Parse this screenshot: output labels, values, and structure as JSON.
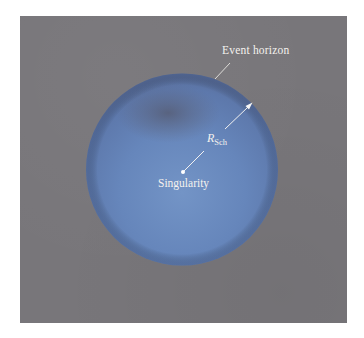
{
  "figure": {
    "labels": {
      "event_horizon": "Event horizon",
      "singularity": "Singularity",
      "radius_symbol": "R",
      "radius_subscript": "Sch"
    },
    "colors": {
      "background_panel": "#78767a",
      "sphere_light": "#6b8cc0",
      "sphere_dark": "#5f6a8a",
      "annotation": "#f4f2ee"
    }
  }
}
